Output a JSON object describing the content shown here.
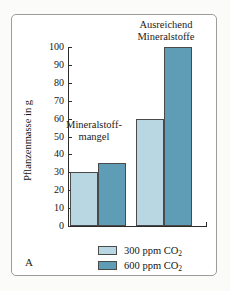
{
  "panel": {
    "letter": "A"
  },
  "chart_data": {
    "type": "bar",
    "title": "",
    "xlabel": "",
    "ylabel": "Pflanzenmasse in g",
    "ylim": [
      0,
      100
    ],
    "yticks": [
      0,
      10,
      20,
      30,
      40,
      50,
      60,
      70,
      80,
      90,
      100
    ],
    "ytick_labels": [
      "0",
      "10",
      "20",
      "30",
      "40",
      "50",
      "60",
      "70",
      "80",
      "90",
      "100"
    ],
    "grid": false,
    "legend_position": "bottom",
    "categories": [
      "Mineralstoffmangel",
      "Ausreichend Mineralstoffe"
    ],
    "series": [
      {
        "name": "300 ppm CO2",
        "label": "300 ppm CO",
        "label_sub": "2",
        "color": "#b9d7e3",
        "values": [
          30,
          60
        ]
      },
      {
        "name": "600 ppm CO2",
        "label": "600 ppm CO",
        "label_sub": "2",
        "color": "#5f9cb5",
        "values": [
          35,
          100
        ]
      }
    ],
    "annotations": [
      {
        "id": "group-left",
        "line1": "Mineralstoff-",
        "line2": "mangel"
      },
      {
        "id": "group-right",
        "line1": "Ausreichend",
        "line2": "Mineralstoffe"
      }
    ]
  }
}
